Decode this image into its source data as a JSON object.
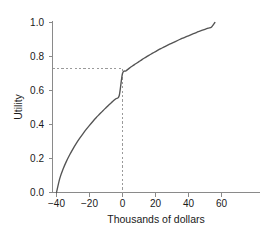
{
  "chart_data": {
    "type": "line",
    "title": "",
    "xlabel": "Thousands of dollars",
    "ylabel": "Utility",
    "xlim": [
      -42,
      68
    ],
    "ylim": [
      -0.02,
      1.03
    ],
    "grid": false,
    "legend": null,
    "xticks": [
      -40,
      -20,
      0,
      20,
      40,
      60
    ],
    "xtick_labels": [
      "−40",
      "−20",
      "0",
      "20",
      "40",
      "60"
    ],
    "yticks": [
      0.0,
      0.2,
      0.4,
      0.6,
      0.8,
      1.0
    ],
    "ytick_labels": [
      "0.0",
      "0.2",
      "0.4",
      "0.6",
      "0.8",
      "1.0"
    ],
    "series": [
      {
        "name": "utility",
        "color": "#545454",
        "style": "solid",
        "x": [
          -40,
          -38,
          -36,
          -34,
          -32,
          -30,
          -28,
          -26,
          -24,
          -22,
          -20,
          -18,
          -16,
          -14,
          -12,
          -10,
          -8,
          -6,
          -4,
          -2,
          0,
          2,
          4,
          6,
          8,
          10,
          12,
          14,
          16,
          18,
          20,
          22,
          24,
          26,
          28,
          30,
          32,
          34,
          36,
          38,
          40,
          42,
          44,
          46,
          48,
          50,
          52,
          54,
          56
        ],
        "y": [
          0.0,
          0.083,
          0.138,
          0.183,
          0.222,
          0.257,
          0.289,
          0.318,
          0.345,
          0.371,
          0.395,
          0.418,
          0.44,
          0.46,
          0.48,
          0.499,
          0.518,
          0.535,
          0.552,
          0.569,
          0.7,
          0.715,
          0.73,
          0.744,
          0.757,
          0.77,
          0.783,
          0.795,
          0.807,
          0.818,
          0.829,
          0.84,
          0.85,
          0.86,
          0.87,
          0.879,
          0.888,
          0.897,
          0.906,
          0.914,
          0.922,
          0.93,
          0.938,
          0.946,
          0.953,
          0.96,
          0.967,
          0.974,
          1.0
        ]
      }
    ],
    "annotations": [
      {
        "name": "reference-lines",
        "style": "dashed",
        "color": "#9a9a9a",
        "x_value": 0,
        "y_value": 0.7,
        "description": "Dashed vertical line at x = 0 and dashed horizontal line at utility = 0.70 meeting on the curve"
      }
    ]
  }
}
